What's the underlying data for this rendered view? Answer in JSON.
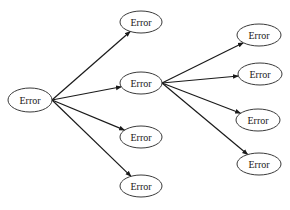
{
  "diagram": {
    "type": "tree",
    "direction": "left-to-right",
    "colors": {
      "stroke": "#3a3a3a",
      "edge": "#1a1a1a",
      "text": "#1a1a1a",
      "background": "#ffffff"
    },
    "nodes": [
      {
        "id": "n0",
        "label": "Error",
        "cx": 30,
        "cy": 100,
        "rx": 22,
        "ry": 12
      },
      {
        "id": "n1",
        "label": "Error",
        "cx": 141,
        "cy": 22,
        "rx": 21,
        "ry": 11
      },
      {
        "id": "n2",
        "label": "Error",
        "cx": 141,
        "cy": 83,
        "rx": 21,
        "ry": 11
      },
      {
        "id": "n3",
        "label": "Error",
        "cx": 141,
        "cy": 137,
        "rx": 21,
        "ry": 11
      },
      {
        "id": "n4",
        "label": "Error",
        "cx": 141,
        "cy": 186,
        "rx": 21,
        "ry": 11
      },
      {
        "id": "n5",
        "label": "Error",
        "cx": 259,
        "cy": 35,
        "rx": 22,
        "ry": 11
      },
      {
        "id": "n6",
        "label": "Error",
        "cx": 260,
        "cy": 74,
        "rx": 22,
        "ry": 11
      },
      {
        "id": "n7",
        "label": "Error",
        "cx": 258,
        "cy": 120,
        "rx": 22,
        "ry": 11
      },
      {
        "id": "n8",
        "label": "Error",
        "cx": 259,
        "cy": 164,
        "rx": 22,
        "ry": 11
      }
    ],
    "edges": [
      {
        "from": "n0",
        "to": "n1"
      },
      {
        "from": "n0",
        "to": "n2"
      },
      {
        "from": "n0",
        "to": "n3"
      },
      {
        "from": "n0",
        "to": "n4"
      },
      {
        "from": "n2",
        "to": "n5"
      },
      {
        "from": "n2",
        "to": "n6"
      },
      {
        "from": "n2",
        "to": "n7"
      },
      {
        "from": "n2",
        "to": "n8"
      }
    ]
  }
}
